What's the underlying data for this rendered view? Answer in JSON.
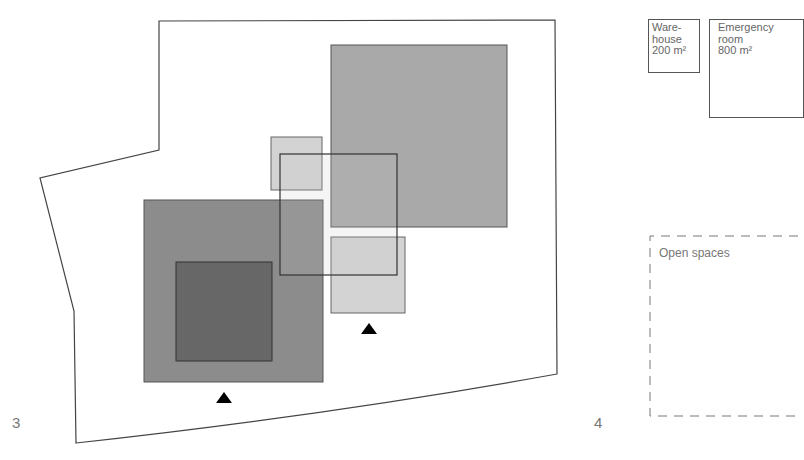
{
  "figures": [
    {
      "number": "3",
      "description": "site plan with overlapping program blocks"
    },
    {
      "number": "4",
      "description": "program area boxes"
    }
  ],
  "site_plan": {
    "outline_color": "#444444",
    "blocks": [
      {
        "name": "large-medium-square",
        "fill": "#a8a8a8"
      },
      {
        "name": "small-light-square-top",
        "fill": "#d4d4d4"
      },
      {
        "name": "small-light-square-bottom",
        "fill": "#d4d4d4"
      },
      {
        "name": "medium-dark-square",
        "fill": "#8a8a8a"
      },
      {
        "name": "dark-inner-square",
        "fill": "#666666"
      },
      {
        "name": "outline-rect",
        "fill": "none"
      }
    ],
    "entrances": [
      {
        "name": "entrance-left"
      },
      {
        "name": "entrance-right"
      }
    ]
  },
  "program": {
    "warehouse": {
      "line1": "Ware-",
      "line2": "house",
      "area": "200 m²"
    },
    "emergency_room": {
      "line1": "Emergency",
      "line2": "room",
      "area": "800 m²"
    },
    "open_spaces": {
      "label": "Open spaces"
    }
  }
}
